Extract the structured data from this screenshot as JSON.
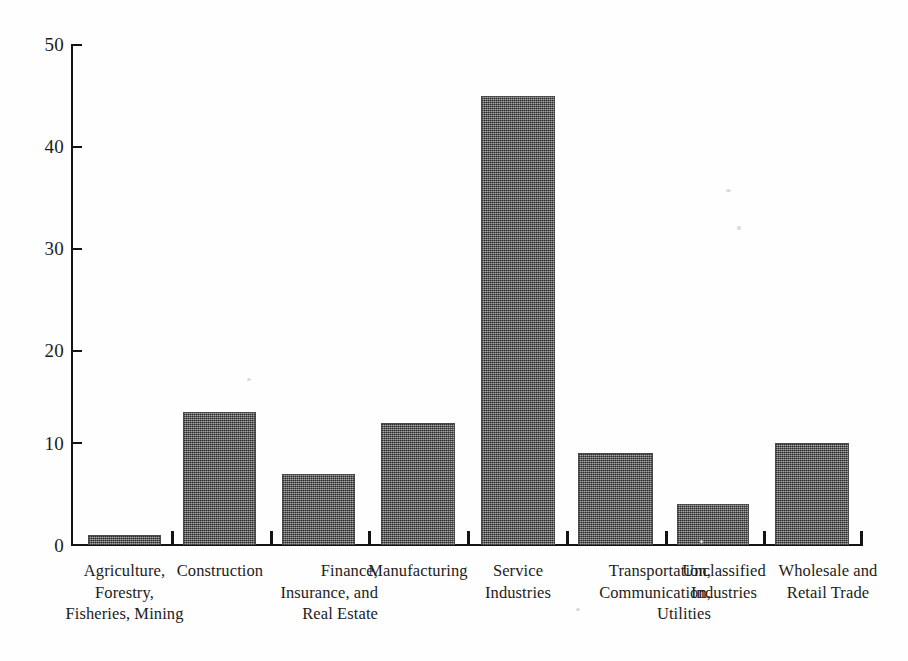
{
  "chart_data": {
    "type": "bar",
    "title": "",
    "subtitle": "",
    "xlabel": "",
    "ylabel": "",
    "ylim": [
      0,
      50
    ],
    "ytick_labels": [
      "0",
      "10",
      "20",
      "30",
      "40",
      "50"
    ],
    "ytick_values": [
      0,
      10,
      20,
      30,
      40,
      50
    ],
    "grid": false,
    "legend": false,
    "legend_position": "none",
    "bar_color": "#7b7b7b",
    "bar_edge_color": "#4a4a4a",
    "background_color": "#fefefe",
    "axis_color": "#141414",
    "categories": [
      "Agriculture, Forestry, Fisheries, Mining",
      "Construction",
      "Finance, Insurance, and Real Estate",
      "Manufacturing",
      "Service Industries",
      "Transportation, Communication, Utilities",
      "Unclassified Industries",
      "Wholesale and Retail Trade"
    ],
    "category_label_lines": [
      [
        "Agriculture,",
        "Forestry,",
        "Fisheries, Mining"
      ],
      [
        "Construction"
      ],
      [
        "Finance,",
        "Insurance, and",
        "Real Estate"
      ],
      [
        "Manufacturing"
      ],
      [
        "Service",
        "Industries"
      ],
      [
        "Transportation,",
        "Communication,",
        "Utilities"
      ],
      [
        "Unclassified",
        "Industries"
      ],
      [
        "Wholesale and",
        "Retail Trade"
      ]
    ],
    "values": [
      1,
      13,
      7,
      12,
      44,
      9,
      4,
      10
    ]
  },
  "axis": {
    "y_ticks": [
      {
        "label": "50",
        "value": 50
      },
      {
        "label": "40",
        "value": 40
      },
      {
        "label": "30",
        "value": 30
      },
      {
        "label": "20",
        "value": 20
      },
      {
        "label": "10",
        "value": 10
      },
      {
        "label": "0",
        "value": 0
      }
    ]
  }
}
